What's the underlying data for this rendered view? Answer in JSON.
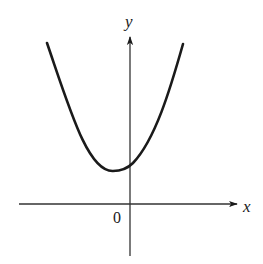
{
  "figure": {
    "type": "function-graph",
    "colors": {
      "curve": "#1a1a1a",
      "axes": "#333333",
      "background": "#ffffff"
    }
  },
  "axes": {
    "x_label": "x",
    "y_label": "y",
    "origin_label": "0"
  },
  "curve": {
    "shape": "parabola",
    "opens": "up",
    "vertex_position": "left of y-axis, above x-axis",
    "y_intercept": "positive"
  }
}
